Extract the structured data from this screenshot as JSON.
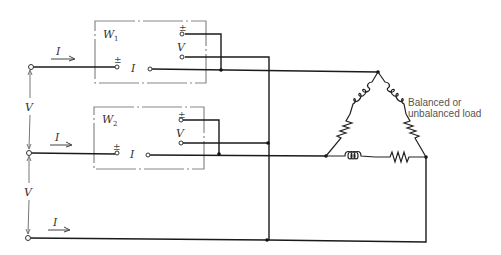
{
  "diagram": {
    "type": "two-wattmeter three-phase power measurement circuit",
    "wattmeters": [
      {
        "name": "W",
        "subscript": "1",
        "current_terminal_pm": "±",
        "current_label": "I",
        "voltage_terminal_pm": "±",
        "voltage_label": "V"
      },
      {
        "name": "W",
        "subscript": "2",
        "current_terminal_pm": "±",
        "current_label": "I",
        "voltage_terminal_pm": "±",
        "voltage_label": "V"
      }
    ],
    "line_currents": [
      "I",
      "I",
      "I"
    ],
    "line_voltages": [
      "V",
      "V"
    ],
    "load_label_line1": "Balanced or",
    "load_label_line2": "unbalanced load"
  }
}
